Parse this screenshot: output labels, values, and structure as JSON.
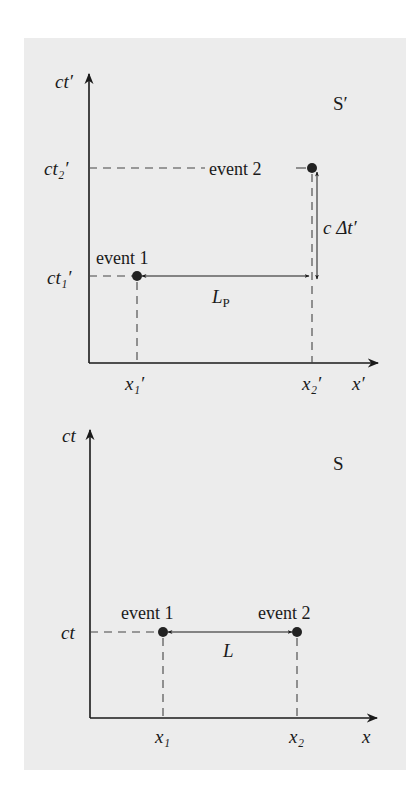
{
  "figure": {
    "type": "spacetime-diagrams",
    "colors": {
      "background": "#ececec",
      "ink": "#1a1a1a"
    }
  },
  "top_diagram": {
    "frame_label": "S′",
    "y_axis_label": "ct′",
    "x_axis_label": "x′",
    "y_ticks": [
      "ct₂′",
      "ct₁′"
    ],
    "x_ticks": [
      "x₁′",
      "x₂′"
    ],
    "events": [
      {
        "label": "event 1",
        "x_tick": "x₁′",
        "y_tick": "ct₁′"
      },
      {
        "label": "event 2",
        "x_tick": "x₂′",
        "y_tick": "ct₂′"
      }
    ],
    "horizontal_interval_label": "L",
    "horizontal_interval_subscript": "P",
    "vertical_interval_label": "c Δt′"
  },
  "bottom_diagram": {
    "frame_label": "S",
    "y_axis_label": "ct",
    "x_axis_label": "x",
    "y_ticks": [
      "ct"
    ],
    "x_ticks": [
      "x₁",
      "x₂"
    ],
    "events": [
      {
        "label": "event 1",
        "x_tick": "x₁",
        "y_tick": "ct"
      },
      {
        "label": "event 2",
        "x_tick": "x₂",
        "y_tick": "ct"
      }
    ],
    "horizontal_interval_label": "L"
  }
}
